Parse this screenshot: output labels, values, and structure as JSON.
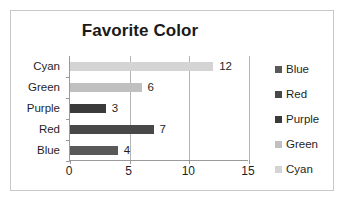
{
  "chart_data": {
    "type": "bar",
    "orientation": "horizontal",
    "title": "Favorite Color",
    "xlabel": "",
    "ylabel": "",
    "categories": [
      "Blue",
      "Red",
      "Purple",
      "Green",
      "Cyan"
    ],
    "values": [
      4,
      7,
      3,
      6,
      12
    ],
    "value_labels": [
      "4",
      "7",
      "3",
      "6",
      "12"
    ],
    "display_order_top_to_bottom": [
      "Cyan",
      "Green",
      "Purple",
      "Red",
      "Blue"
    ],
    "xlim": [
      0,
      15
    ],
    "xticks": [
      0,
      5,
      10,
      15
    ],
    "xtick_labels": [
      "0",
      "5",
      "10",
      "15"
    ],
    "grid": "vertical",
    "legend_position": "right",
    "legend": [
      {
        "label": "Blue",
        "color": "#595959"
      },
      {
        "label": "Red",
        "color": "#484848"
      },
      {
        "label": "Purple",
        "color": "#3a3a3a"
      },
      {
        "label": "Green",
        "color": "#c0c0c0"
      },
      {
        "label": "Cyan",
        "color": "#d4d4d4"
      }
    ],
    "series_colors": {
      "Blue": "#595959",
      "Red": "#484848",
      "Purple": "#3a3a3a",
      "Green": "#c0c0c0",
      "Cyan": "#d4d4d4"
    },
    "colors": {
      "title_text": "#1a1a1a",
      "axis_line": "#9a9a9a",
      "gridline": "#b3b3b3",
      "frame_border": "#c9c9c9",
      "background": "#ffffff",
      "label_text": "#1f1f1f"
    }
  }
}
